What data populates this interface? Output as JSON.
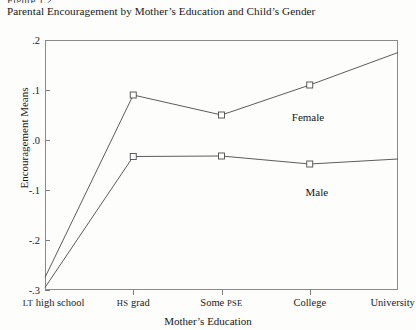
{
  "figure": {
    "number": "Figure 1.2",
    "title": "Parental Encouragement by Mother’s Education and Child’s Gender"
  },
  "chart_data": {
    "type": "line",
    "title": "Parental Encouragement by Mother’s Education and Child’s Gender",
    "xlabel": "Mother’s Education",
    "ylabel": "Encouragement Means",
    "categories": [
      "LT high school",
      "HS grad",
      "Some PSE",
      "College",
      "University"
    ],
    "category_parts": [
      {
        "small_caps": "LT",
        "rest": " high school"
      },
      {
        "small_caps": "HS",
        "rest": " grad"
      },
      {
        "small_caps": "",
        "rest": "Some ",
        "small_caps_tail": "PSE"
      },
      {
        "small_caps": "",
        "rest": "College"
      },
      {
        "small_caps": "",
        "rest": "University"
      }
    ],
    "series": [
      {
        "name": "Female",
        "values": [
          -0.275,
          0.09,
          0.05,
          0.11,
          0.175
        ],
        "marker": "open-square"
      },
      {
        "name": "Male",
        "values": [
          -0.295,
          -0.033,
          -0.032,
          -0.048,
          -0.038
        ],
        "marker": "open-square"
      }
    ],
    "ylim": [
      -0.3,
      0.2
    ],
    "yticks": [
      0.2,
      0.1,
      0.0,
      -0.1,
      -0.2,
      -0.3
    ],
    "ytick_labels": [
      ".2",
      ".1",
      ".0",
      "-.1",
      "-.2",
      "-.3"
    ],
    "grid": false,
    "legend": "inline-annotations",
    "annotations": [
      {
        "text": "Female",
        "x_category_fraction": 0.745,
        "value": 0.045
      },
      {
        "text": "Male",
        "x_category_fraction": 0.77,
        "value": -0.105
      }
    ],
    "line_color": "#4a4a4a",
    "frame_color": "#8a8a8a"
  }
}
